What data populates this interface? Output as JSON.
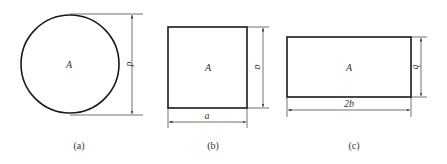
{
  "figure": {
    "panels": [
      {
        "id": "a",
        "shape": "circle",
        "area_label": "A",
        "dimensions": [
          {
            "label": "d",
            "orientation": "vertical",
            "meaning": "diameter"
          }
        ],
        "caption": "(a)"
      },
      {
        "id": "b",
        "shape": "square",
        "area_label": "A",
        "dimensions": [
          {
            "label": "a",
            "orientation": "vertical"
          },
          {
            "label": "a",
            "orientation": "horizontal"
          }
        ],
        "caption": "(b)"
      },
      {
        "id": "c",
        "shape": "rectangle",
        "area_label": "A",
        "dimensions": [
          {
            "label": "b",
            "orientation": "vertical"
          },
          {
            "label": "2b",
            "orientation": "horizontal"
          }
        ],
        "caption": "(c)"
      }
    ]
  }
}
